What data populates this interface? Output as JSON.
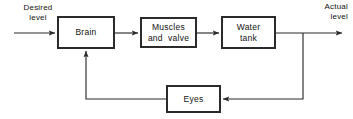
{
  "diagram": {
    "type": "block-diagram",
    "stroke_color": "#2b2b2b",
    "background_color": "#ffffff",
    "blocks": [
      {
        "id": "brain",
        "label": "Brain",
        "lines": [
          "Brain"
        ]
      },
      {
        "id": "muscles",
        "label": "Muscles and valve",
        "lines": [
          "Muscles",
          "and  valve"
        ]
      },
      {
        "id": "tank",
        "label": "Water tank",
        "lines": [
          "Water",
          "tank"
        ]
      },
      {
        "id": "eyes",
        "label": "Eyes",
        "lines": [
          "Eyes"
        ]
      }
    ],
    "io_labels": {
      "input": {
        "lines": [
          "Desired",
          "level"
        ],
        "text": "Desired level"
      },
      "output": {
        "lines": [
          "Actual",
          "level"
        ],
        "text": "Actual level"
      }
    },
    "connections": [
      {
        "from": "input",
        "to": "brain",
        "arrow": true
      },
      {
        "from": "brain",
        "to": "muscles",
        "arrow": true
      },
      {
        "from": "muscles",
        "to": "tank",
        "arrow": true
      },
      {
        "from": "tank",
        "to": "output",
        "arrow": true
      },
      {
        "from": "output",
        "to": "eyes",
        "arrow": true
      },
      {
        "from": "eyes",
        "to": "brain",
        "arrow": true
      }
    ]
  }
}
